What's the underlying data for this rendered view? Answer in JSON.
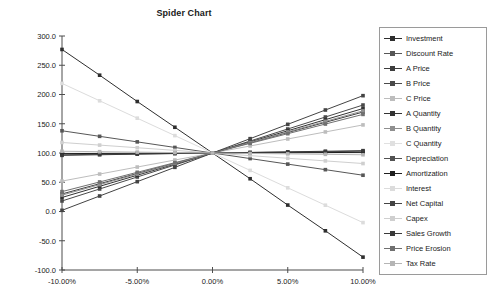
{
  "chart_data": {
    "type": "line",
    "title": "Spider Chart",
    "xlabel": "",
    "ylabel": "",
    "xlim": [
      -10,
      10
    ],
    "ylim": [
      -100,
      300
    ],
    "grid": false,
    "legend_position": "right",
    "x": [
      -10,
      -7.5,
      -5,
      -2.5,
      0,
      2.5,
      5,
      7.5,
      10
    ],
    "xtick_labels": [
      "-10.00%",
      "-5.00%",
      "0.00%",
      "5.00%",
      "10.00%"
    ],
    "xtick_values": [
      -10,
      -5,
      0,
      5,
      10
    ],
    "ytick_labels": [
      "300.0",
      "250.0",
      "200.0",
      "150.0",
      "100.0",
      "50.0",
      "0.0",
      "-50.0",
      "-100.0"
    ],
    "ytick_values": [
      300,
      250,
      200,
      150,
      100,
      50,
      0,
      -50,
      -100
    ],
    "pivot": {
      "x": 0,
      "y": 100
    },
    "series": [
      {
        "name": "Investment",
        "color": "#2e2e2e",
        "values": [
          277,
          233,
          188,
          144,
          100,
          56,
          11,
          -33,
          -78
        ]
      },
      {
        "name": "Discount Rate",
        "color": "#575757",
        "values": [
          138,
          128.5,
          119,
          109.5,
          100,
          90.5,
          81,
          71.5,
          62
        ]
      },
      {
        "name": "A Price",
        "color": "#3d3d3d",
        "values": [
          30,
          47.5,
          65,
          82.5,
          100,
          117.5,
          135,
          152.5,
          170
        ]
      },
      {
        "name": "B Price",
        "color": "#4a4a4a",
        "values": [
          18,
          38.5,
          59,
          79.5,
          100,
          120.5,
          141,
          161.5,
          182
        ]
      },
      {
        "name": "C Price",
        "color": "#bdbdbd",
        "values": [
          52,
          64,
          76,
          88,
          100,
          112,
          124,
          136,
          148
        ]
      },
      {
        "name": "A Quantity",
        "color": "#333333",
        "values": [
          24,
          43,
          62,
          81,
          100,
          119,
          138,
          157,
          176
        ]
      },
      {
        "name": "B Quantity",
        "color": "#8f8f8f",
        "values": [
          28,
          46,
          64,
          82,
          100,
          118,
          136,
          154,
          172
        ]
      },
      {
        "name": "C Quantity",
        "color": "#e0e0e0",
        "values": [
          100,
          100,
          100,
          100,
          100,
          100,
          100,
          100,
          100
        ]
      },
      {
        "name": "Depreciation",
        "color": "#525252",
        "values": [
          97,
          97.75,
          98.5,
          99.25,
          100,
          100.75,
          101.5,
          102.25,
          103
        ]
      },
      {
        "name": "Amortization",
        "color": "#1f1f1f",
        "values": [
          99,
          99.25,
          99.5,
          99.75,
          100,
          100.25,
          100.5,
          100.75,
          101
        ]
      },
      {
        "name": "Interest",
        "color": "#dcdcdc",
        "values": [
          219,
          189.25,
          159.5,
          129.75,
          100,
          70.25,
          40.5,
          10.75,
          -19
        ]
      },
      {
        "name": "Net Capital",
        "color": "#444444",
        "values": [
          2,
          26.5,
          51,
          75.5,
          100,
          124.5,
          149,
          173.5,
          198
        ]
      },
      {
        "name": "Capex",
        "color": "#cfcfcf",
        "values": [
          118,
          113.5,
          109,
          104.5,
          100,
          95.5,
          91,
          86.5,
          82
        ]
      },
      {
        "name": "Sales Growth",
        "color": "#3a3a3a",
        "values": [
          96,
          97,
          98,
          99,
          100,
          101,
          102,
          103,
          104
        ]
      },
      {
        "name": "Price Erosion",
        "color": "#707070",
        "values": [
          34,
          50.5,
          67,
          83.5,
          100,
          116.5,
          133,
          149.5,
          166
        ]
      },
      {
        "name": "Tax Rate",
        "color": "#b5b5b5",
        "values": [
          103,
          102.25,
          101.5,
          100.75,
          100,
          99.25,
          98.5,
          97.75,
          97
        ]
      }
    ]
  },
  "axes": {
    "axis_color": "#4d4d4d"
  }
}
